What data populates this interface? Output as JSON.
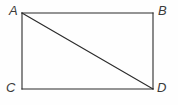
{
  "figure": {
    "kind": "geometry-diagram",
    "background_color": "#fefefe",
    "stroke_color": "#2b2b2b",
    "label_color": "#3b3b3b",
    "stroke_width": 1.1,
    "rectangle": {
      "left": 22,
      "top": 13,
      "right": 153,
      "bottom": 89,
      "width": 131,
      "height": 76
    },
    "vertices": [
      {
        "id": "A",
        "label": "A",
        "x": 22,
        "y": 13,
        "position": "top-left"
      },
      {
        "id": "B",
        "label": "B",
        "x": 153,
        "y": 13,
        "position": "top-right"
      },
      {
        "id": "C",
        "label": "C",
        "x": 22,
        "y": 89,
        "position": "bottom-left"
      },
      {
        "id": "D",
        "label": "D",
        "x": 153,
        "y": 89,
        "position": "bottom-right"
      }
    ],
    "segments": [
      {
        "name": "AB",
        "from": "A",
        "to": "B",
        "kind": "side"
      },
      {
        "name": "BD",
        "from": "B",
        "to": "D",
        "kind": "side"
      },
      {
        "name": "DC",
        "from": "D",
        "to": "C",
        "kind": "side"
      },
      {
        "name": "CA",
        "from": "C",
        "to": "A",
        "kind": "side"
      },
      {
        "name": "AD",
        "from": "A",
        "to": "D",
        "kind": "diagonal"
      }
    ]
  }
}
